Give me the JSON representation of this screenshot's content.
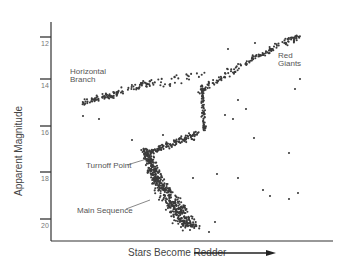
{
  "chart_data": {
    "type": "scatter",
    "title": "",
    "xlabel": "Stars Become Redder",
    "ylabel": "Apparent Magnitude",
    "y_ticks": [
      "12",
      "14",
      "16",
      "18",
      "20"
    ],
    "ylim": [
      11.5,
      20.5
    ],
    "y_inverted": true,
    "grid": false,
    "annotations": [
      {
        "text": "Horizontal Branch",
        "lines": [
          "Horizontal",
          "Branch"
        ]
      },
      {
        "text": "Red Giants",
        "lines": [
          "Red",
          "Giants"
        ]
      },
      {
        "text": "Turnoff Point"
      },
      {
        "text": "Main Sequence"
      }
    ],
    "regions": [
      {
        "name": "Main Sequence",
        "color_index_range": [
          0.25,
          0.45
        ],
        "magnitude_range": [
          17,
          20.3
        ],
        "points": 520
      },
      {
        "name": "Turnoff Point",
        "color_index_range": [
          0.3,
          0.45
        ],
        "magnitude_range": [
          16.3,
          17
        ],
        "points": 60
      },
      {
        "name": "Subgiant Branch",
        "color_index_range": [
          0.35,
          0.6
        ],
        "magnitude_range": [
          15.6,
          16.8
        ],
        "points": 90
      },
      {
        "name": "Red Giant Branch",
        "color_index_range": [
          0.55,
          1.0
        ],
        "magnitude_range": [
          12,
          15.6
        ],
        "points": 170
      },
      {
        "name": "Horizontal Branch",
        "color_index_range": [
          0.05,
          0.3
        ],
        "magnitude_range": [
          14,
          15
        ],
        "points": 110
      },
      {
        "name": "Field stars",
        "color_index_range": [
          0.3,
          0.9
        ],
        "magnitude_range": [
          13,
          20
        ],
        "points": 30
      }
    ]
  },
  "axis": {
    "y_label": "Apparent Magnitude",
    "x_label": "Stars Become Redder",
    "ticks": [
      {
        "label": "12",
        "y": 37
      },
      {
        "label": "14",
        "y": 79
      },
      {
        "label": "16",
        "y": 126
      },
      {
        "label": "18",
        "y": 172
      },
      {
        "label": "20",
        "y": 219
      }
    ]
  },
  "labels": {
    "horizontal_branch_1": "Horizontal",
    "horizontal_branch_2": "Branch",
    "red_giants_1": "Red",
    "red_giants_2": "Giants",
    "turnoff_point": "Turnoff Point",
    "main_sequence": "Main Sequence"
  },
  "colors": {
    "dot": "#3a3a3a",
    "axis": "#333333",
    "text": "#555555"
  }
}
